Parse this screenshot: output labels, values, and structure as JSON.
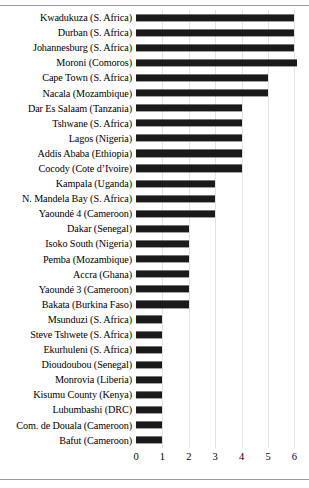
{
  "figure": {
    "has_top_rule": true,
    "has_bottom_rule": true,
    "bar_color": "#1a1a1a",
    "grid_color": "#e2e2e2"
  },
  "chart_data": {
    "type": "bar",
    "orientation": "horizontal",
    "title": "",
    "xlabel": "",
    "ylabel": "",
    "xlim": [
      0,
      6.4
    ],
    "xticks": [
      0,
      1,
      2,
      3,
      4,
      5,
      6
    ],
    "xticklabels": [
      "0",
      "1",
      "2",
      "3",
      "4",
      "5",
      "6"
    ],
    "grid": true,
    "legend": null,
    "categories": [
      "Kwadukuza (S. Africa)",
      "Durban (S. Africa)",
      "Johannesburg (S. Africa)",
      "Moroni (Comoros)",
      "Cape Town (S. Africa)",
      "Nacala (Mozambique)",
      "Dar Es Salaam (Tanzania)",
      "Tshwane (S. Africa)",
      "Lagos (Nigeria)",
      "Addis Ababa (Ethiopia)",
      "Cocody (Cote d’Ivoire)",
      "Kampala (Uganda)",
      "N. Mandela Bay (S. Africa)",
      "Yaoundé 4 (Cameroon)",
      "Dakar (Senegal)",
      "Isoko South (Nigeria)",
      "Pemba (Mozambique)",
      "Accra (Ghana)",
      "Yaoundé 3 (Cameroon)",
      "Bakata (Burkina Faso)",
      "Msunduzi (S. Africa)",
      "Steve Tshwete (S. Africa)",
      "Ekurhuleni (S. Africa)",
      "Dioudoubou (Senegal)",
      "Monrovia (Liberia)",
      "Kisumu County (Kenya)",
      "Lubumbashi (DRC)",
      "Com. de Douala (Cameroon)",
      "Bafut (Cameroon)"
    ],
    "values": [
      6.0,
      6.0,
      6.0,
      6.1,
      5.0,
      5.0,
      4.0,
      4.0,
      4.0,
      4.0,
      4.0,
      3.0,
      3.0,
      3.0,
      2.0,
      2.0,
      2.0,
      2.0,
      2.0,
      2.0,
      1.0,
      1.0,
      1.0,
      1.0,
      1.0,
      1.0,
      1.0,
      1.0,
      1.0
    ]
  }
}
